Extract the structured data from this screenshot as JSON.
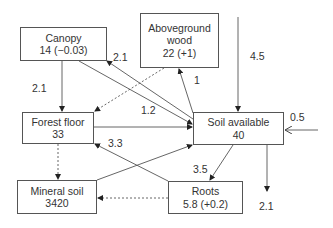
{
  "nodes": {
    "canopy": {
      "name": "Canopy",
      "value": "14 (−0.03)"
    },
    "wood": {
      "name": "Aboveground",
      "name2": "wood",
      "value": "22 (+1)"
    },
    "forest_floor": {
      "name": "Forest floor",
      "value": "33"
    },
    "soil_available": {
      "name": "Soil available",
      "value": "40"
    },
    "mineral_soil": {
      "name": "Mineral soil",
      "value": "3420"
    },
    "roots": {
      "name": "Roots",
      "value": "5.8 (+0.2)"
    }
  },
  "flows": {
    "canopy_to_forest_floor": "2.1",
    "soil_to_canopy": "2.1",
    "soil_to_wood": "1",
    "input_top": "4.5",
    "forest_floor_to_soil": "1.2",
    "roots_to_forest_floor": "3.3",
    "input_right": "0.5",
    "soil_to_roots": "3.5",
    "output_bottom": "2.1"
  }
}
